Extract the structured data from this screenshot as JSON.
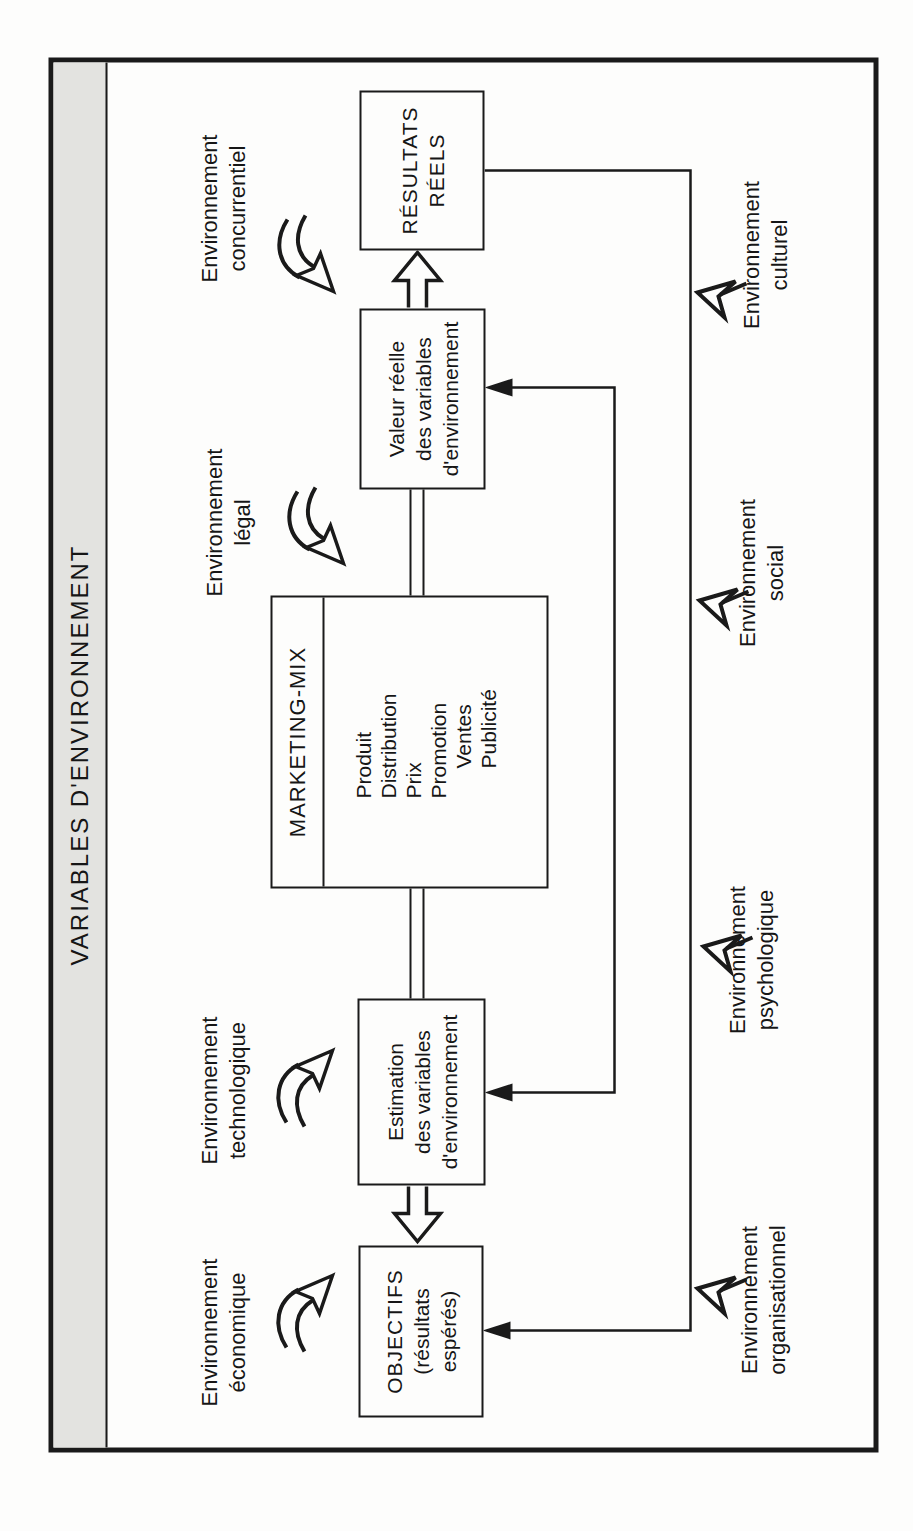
{
  "figure": {
    "title": "VARIABLES D'ENVIRONNEMENT"
  },
  "boxes": {
    "objectifs": {
      "lines": [
        "OBJECTIFS",
        "(résultats",
        "espérés)"
      ]
    },
    "estimation": {
      "lines": [
        "Estimation",
        "des variables",
        "d'environnement"
      ]
    },
    "marketing_mix": {
      "header": "MARKETING-MIX",
      "items": [
        "Produit",
        "Distribution",
        "Prix",
        "Promotion",
        "Ventes",
        "Publicité"
      ]
    },
    "valeur_reelle": {
      "lines": [
        "Valeur réelle",
        "des variables",
        "d'environnement"
      ]
    },
    "resultats": {
      "lines": [
        "RÉSULTATS",
        "RÉELS"
      ]
    }
  },
  "environment_labels": {
    "top": [
      {
        "id": "economique",
        "line1": "Environnement",
        "line2": "économique"
      },
      {
        "id": "technologique",
        "line1": "Environnement",
        "line2": "technologique"
      },
      {
        "id": "legal",
        "line1": "Environnement",
        "line2": "légal"
      },
      {
        "id": "concurrentiel",
        "line1": "Environnement",
        "line2": "concurrentiel"
      }
    ],
    "bottom": [
      {
        "id": "organisationnel",
        "line1": "Environnement",
        "line2": "organisationnel"
      },
      {
        "id": "psychologique",
        "line1": "Environnement",
        "line2": "psychologique"
      },
      {
        "id": "social",
        "line1": "Environnement",
        "line2": "social"
      },
      {
        "id": "culturel",
        "line1": "Environnement",
        "line2": "culturel"
      }
    ]
  },
  "colors": {
    "band_gray": "#e3e3e0",
    "ink": "#1a1a1a",
    "paper": "#fdfdfc"
  }
}
